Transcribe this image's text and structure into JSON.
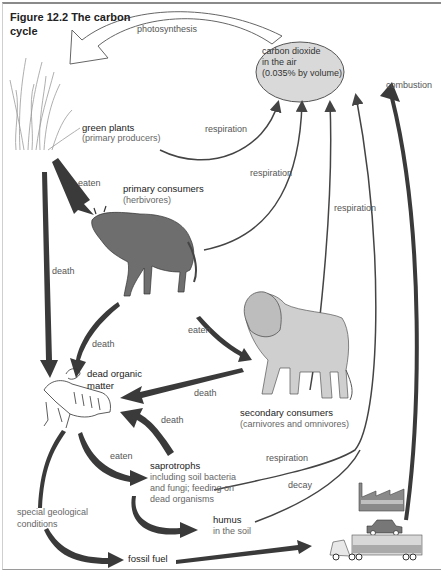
{
  "figure": {
    "title_line1": "Figure 12.2  The carbon",
    "title_line2": "cycle"
  },
  "nodes": {
    "co2": {
      "line1": "carbon dioxide",
      "line2": "in the air",
      "line3": "(0.035% by volume)"
    },
    "green_plants": {
      "name": "green plants",
      "sub": "(primary producers)"
    },
    "primary_consumers": {
      "name": "primary consumers",
      "sub": "(herbivores)"
    },
    "secondary_consumers": {
      "name": "secondary consumers",
      "sub": "(carnivores and omnivores)"
    },
    "dead_organic_matter": {
      "line1": "dead organic",
      "line2": "matter"
    },
    "saprotrophs": {
      "name": "saprotrophs",
      "line1": "including soil bacteria",
      "line2": "and fungi; feeding on",
      "line3": "dead organisms"
    },
    "humus": {
      "name": "humus",
      "sub": "in the soil"
    },
    "fossil_fuel": {
      "name": "fossil fuel"
    },
    "special_geological": {
      "line1": "special geological",
      "line2": "conditions"
    }
  },
  "arrows": {
    "photosynthesis": "photosynthesis",
    "respiration_plants": "respiration",
    "respiration_herbivores": "respiration",
    "respiration_carnivores": "respiration",
    "respiration_saprotrophs": "respiration",
    "combustion": "combustion",
    "eaten_plants": "eaten",
    "eaten_herbivores": "eaten",
    "eaten_saprotrophs": "eaten",
    "death_plants": "death",
    "death_herbivores": "death",
    "death_carnivores": "death",
    "death_saprotrophs": "death",
    "decay": "decay"
  },
  "colors": {
    "ellipse_fill": "#d9d9d9",
    "arrow_dark": "#3a3a3a",
    "line_dark": "#444444",
    "animal_grey": "#6e6e6e",
    "lion_grey": "#cfcfcf"
  }
}
